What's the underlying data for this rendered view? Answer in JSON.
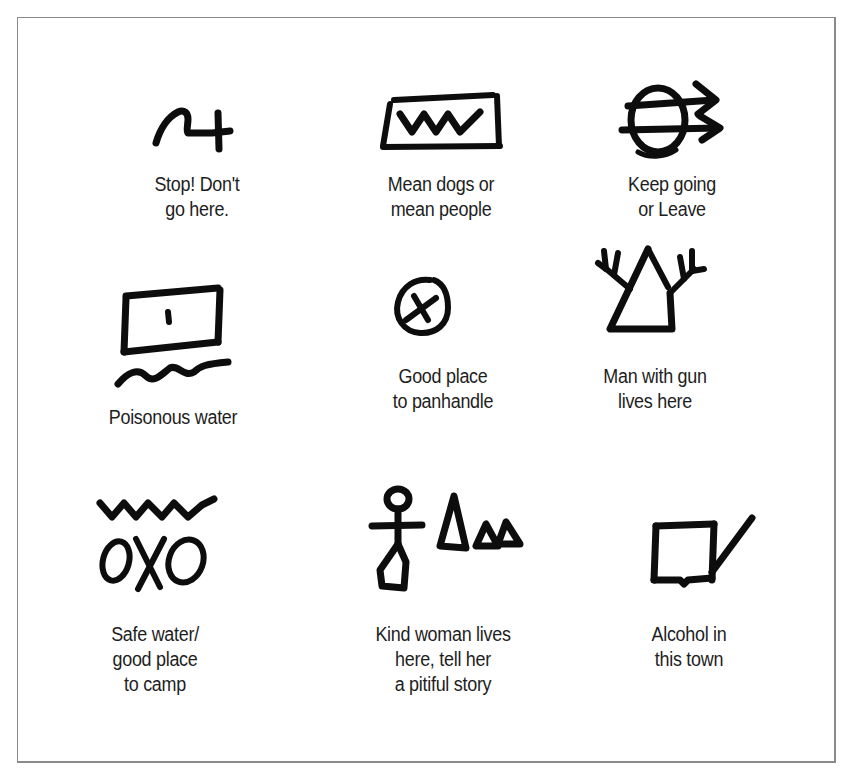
{
  "figure": {
    "type": "hobo-sign-legend",
    "layout": {
      "rows": 3,
      "columns": 3
    },
    "ink_color": "#0d0d0d",
    "frame_color": "#8a8a8a",
    "background": "#ffffff"
  },
  "symbols": [
    {
      "id": "stop",
      "icon": "squiggle-cross-icon",
      "caption_lines": [
        "Stop! Don't",
        "go here."
      ]
    },
    {
      "id": "mean-dogs",
      "icon": "zigzag-in-box-icon",
      "caption_lines": [
        "Mean dogs or",
        "mean people"
      ]
    },
    {
      "id": "keep-going",
      "icon": "circle-with-double-arrows-icon",
      "caption_lines": [
        "Keep going",
        "or Leave"
      ]
    },
    {
      "id": "poisonous-water",
      "icon": "box-with-dot-and-wave-icon",
      "caption_lines": [
        "Poisonous water"
      ]
    },
    {
      "id": "panhandle",
      "icon": "circled-x-icon",
      "caption_lines": [
        "Good place",
        "to panhandle"
      ]
    },
    {
      "id": "man-with-gun",
      "icon": "triangle-with-antlers-icon",
      "caption_lines": [
        "Man with gun",
        "lives here"
      ]
    },
    {
      "id": "safe-water",
      "icon": "zigzag-over-oxo-icon",
      "caption_lines": [
        "Safe water/",
        "good place",
        "to camp"
      ]
    },
    {
      "id": "kind-woman",
      "icon": "figure-with-triangles-icon",
      "caption_lines": [
        "Kind woman lives",
        "here, tell her",
        "a pitiful story"
      ]
    },
    {
      "id": "alcohol",
      "icon": "box-with-check-stroke-icon",
      "caption_lines": [
        "Alcohol in",
        "this town"
      ]
    }
  ]
}
